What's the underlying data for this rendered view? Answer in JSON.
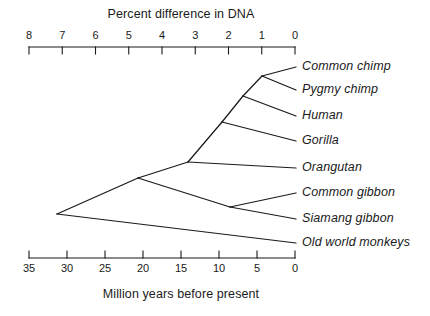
{
  "chart_data": {
    "type": "diagram",
    "subtype": "phylogenetic-tree",
    "title": "",
    "top_axis": {
      "label": "Percent difference in DNA",
      "ticks": [
        "8",
        "7",
        "6",
        "5",
        "4",
        "3",
        "2",
        "1",
        "0"
      ],
      "values": [
        8,
        7,
        6,
        5,
        4,
        3,
        2,
        1,
        0
      ],
      "direction": "right-to-left",
      "range": [
        8,
        0
      ],
      "tick_direction": "down"
    },
    "bottom_axis": {
      "label": "Million years before present",
      "ticks": [
        "35",
        "30",
        "25",
        "20",
        "15",
        "10",
        "5",
        "0"
      ],
      "values": [
        35,
        30,
        25,
        20,
        15,
        10,
        5,
        0
      ],
      "direction": "right-to-left",
      "range": [
        35,
        0
      ],
      "tick_direction": "up"
    },
    "taxa": [
      {
        "name": "Common chimp",
        "tip_y": 67,
        "percent_dna": 0,
        "mya": 0
      },
      {
        "name": "Pygmy chimp",
        "tip_y": 90,
        "percent_dna": 0,
        "mya": 0
      },
      {
        "name": "Human",
        "tip_y": 116,
        "percent_dna": 0,
        "mya": 0
      },
      {
        "name": "Gorilla",
        "tip_y": 141,
        "percent_dna": 0,
        "mya": 0
      },
      {
        "name": "Orangutan",
        "tip_y": 168,
        "percent_dna": 0,
        "mya": 0
      },
      {
        "name": "Common gibbon",
        "tip_y": 193,
        "percent_dna": 0,
        "mya": 0
      },
      {
        "name": "Siamang gibbon",
        "tip_y": 219,
        "percent_dna": 0,
        "mya": 0
      },
      {
        "name": "Old world monkeys",
        "tip_y": 243,
        "percent_dna": 0,
        "mya": 0
      }
    ],
    "nodes": [
      {
        "id": "chimp-split",
        "label": "",
        "percent_dna": 1.1,
        "mya": 4.5
      },
      {
        "id": "human-chimp-split",
        "label": "",
        "percent_dna": 1.4,
        "mya": 6
      },
      {
        "id": "gorilla-split",
        "label": "",
        "percent_dna": 1.9,
        "mya": 8
      },
      {
        "id": "orangutan-split",
        "label": "",
        "percent_dna": 2.8,
        "mya": 12
      },
      {
        "id": "gibbon-split",
        "label": "",
        "percent_dna": 1.2,
        "mya": 5
      },
      {
        "id": "hominoid-split",
        "label": "",
        "percent_dna": 4.1,
        "mya": 18
      },
      {
        "id": "root",
        "label": "",
        "percent_dna": 6.2,
        "mya": 29
      }
    ],
    "line_color": "#1a1a1a",
    "background": "#ffffff"
  },
  "top_axis_title": "Percent difference in DNA",
  "bottom_axis_title": "Million years before present"
}
